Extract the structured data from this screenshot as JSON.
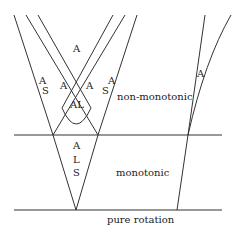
{
  "regions": {
    "non_monotonic": "non-monotonic",
    "monotonic": "monotonic",
    "pure_rotation": "pure rotation"
  },
  "labels": {
    "top_center": "A",
    "left_a": "A",
    "left_s": "S",
    "inner_left_a": "A",
    "inner_right_a": "A",
    "right_a": "A",
    "right_s": "S",
    "al": "AL",
    "v_a": "A",
    "v_l": "L",
    "v_s": "S",
    "far_right_a": "A"
  },
  "colors": {
    "line": "#333333",
    "background": "#ffffff"
  }
}
